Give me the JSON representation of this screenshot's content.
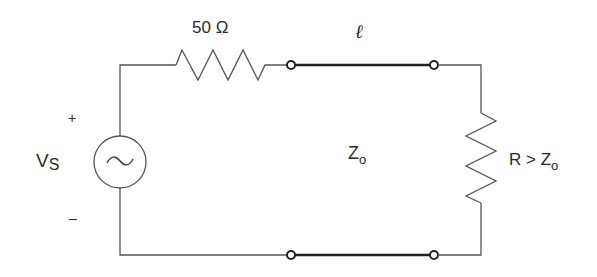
{
  "diagram": {
    "type": "circuit-schematic",
    "source": {
      "label": "V",
      "label_sub": "S",
      "plus": "+",
      "minus": "–",
      "symbol": "~"
    },
    "series_resistor": {
      "label": "50 Ω"
    },
    "transmission_line": {
      "length_label": "ℓ",
      "impedance_label": "Z",
      "impedance_sub": "o"
    },
    "load": {
      "label_prefix": "R > Z",
      "label_sub": "o"
    },
    "colors": {
      "wire": "#555555",
      "line": "#222222",
      "text": "#2a2a2a",
      "background": "#ffffff"
    }
  }
}
